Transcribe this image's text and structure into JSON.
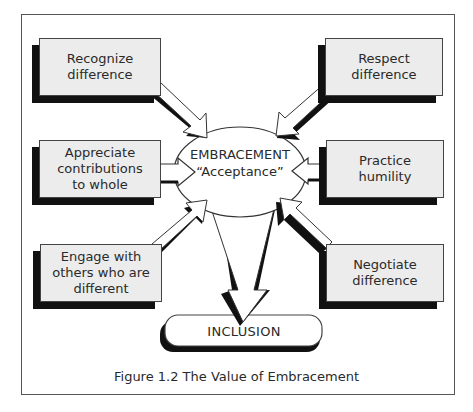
{
  "figure": {
    "caption": "Figure 1.2  The Value of Embracement"
  },
  "center": {
    "title": "EMBRACEMENT",
    "subtitle": "“Acceptance”"
  },
  "outcome": {
    "label": "INCLUSION"
  },
  "left_boxes": [
    {
      "label": "Recognize\ndifference"
    },
    {
      "label": "Appreciate\ncontributions\nto whole"
    },
    {
      "label": "Engage with\nothers who are\ndifferent"
    }
  ],
  "right_boxes": [
    {
      "label": "Respect\ndifference"
    },
    {
      "label": "Practice\nhumility"
    },
    {
      "label": "Negotiate\ndifference"
    }
  ],
  "colors": {
    "box_fill": "#ececec",
    "shadow": "#111111",
    "stroke": "#444444",
    "text": "#2a2a2a"
  }
}
